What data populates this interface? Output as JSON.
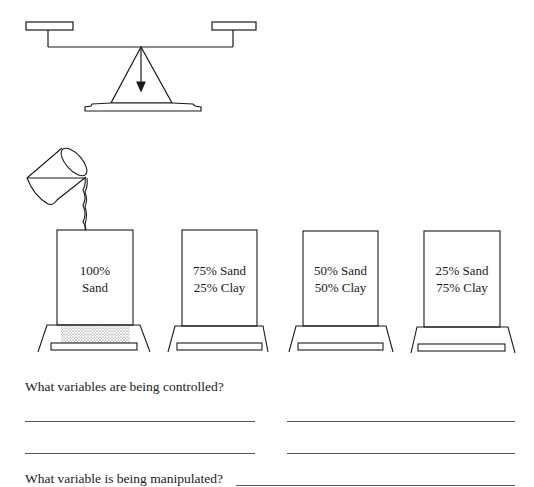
{
  "figure": {
    "balance": {
      "icon": "balance-scale-icon"
    },
    "beaker": {
      "icon": "pouring-beaker-icon",
      "pours_into_container": 0
    },
    "containers": [
      {
        "line1": "100%",
        "line2": "Sand",
        "has_sand_layer": true
      },
      {
        "line1": "75% Sand",
        "line2": "25% Clay",
        "has_sand_layer": false
      },
      {
        "line1": "50% Sand",
        "line2": "50% Clay",
        "has_sand_layer": false
      },
      {
        "line1": "25% Sand",
        "line2": "75% Clay",
        "has_sand_layer": false
      }
    ]
  },
  "questions": {
    "controlled": {
      "text": "What variables are being controlled?",
      "answer_lines": 4
    },
    "manipulated": {
      "text": "What variable is being manipulated?",
      "answer_lines": 1
    }
  },
  "colors": {
    "ink": "#1a1a1a",
    "paper": "#ffffff"
  }
}
